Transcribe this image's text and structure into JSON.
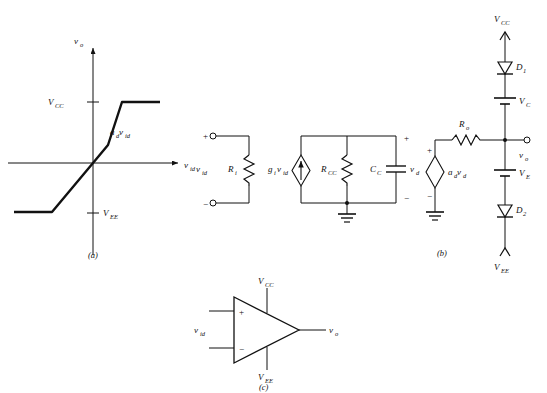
{
  "figure": {
    "stroke_color": "#111111",
    "background_color": "#ffffff"
  },
  "panel_a": {
    "caption": "(a)",
    "y_axis_label": "v",
    "y_axis_sub": "o",
    "x_axis_label": "v",
    "x_axis_sub": "id",
    "upper_limit_label": "V",
    "upper_limit_sub": "CC",
    "lower_limit_label": "V",
    "lower_limit_sub": "EE",
    "slope_label": "a",
    "slope_sub1": "d",
    "slope_label2": "v",
    "slope_sub2": "id"
  },
  "panel_b": {
    "caption": "(b)",
    "input_source_label": "v",
    "input_source_sub": "id",
    "input_resistor_label": "R",
    "input_resistor_sub": "i",
    "plus_sign": "+",
    "minus_sign": "−",
    "current_source_label": "g",
    "current_source_sub1": "i",
    "current_source_label2": "v",
    "current_source_sub2": "id",
    "shunt_resistor_label": "R",
    "shunt_resistor_sub": "CC",
    "capacitor_label": "C",
    "capacitor_sub": "C",
    "capacitor_voltage_label": "v",
    "capacitor_voltage_sub": "d",
    "vcvs_label": "a",
    "vcvs_sub1": "d",
    "vcvs_label2": "v",
    "vcvs_sub2": "d",
    "output_resistor_label": "R",
    "output_resistor_sub": "o",
    "output_label": "v",
    "output_sub": "o",
    "supply_top_label": "V",
    "supply_top_sub": "CC",
    "supply_bottom_label": "V",
    "supply_bottom_sub": "EE",
    "diode_top_label": "D",
    "diode_top_sub": "1",
    "diode_bottom_label": "D",
    "diode_bottom_sub": "2",
    "battery_top_label": "V",
    "battery_top_sub": "C",
    "battery_bottom_label": "V",
    "battery_bottom_sub": "E"
  },
  "panel_c": {
    "caption": "(c)",
    "input_label": "v",
    "input_sub": "id",
    "output_label": "v",
    "output_sub": "o",
    "supply_top_label": "V",
    "supply_top_sub": "CC",
    "supply_bottom_label": "V",
    "supply_bottom_sub": "EE",
    "noninverting_sign": "+",
    "inverting_sign": "−"
  }
}
